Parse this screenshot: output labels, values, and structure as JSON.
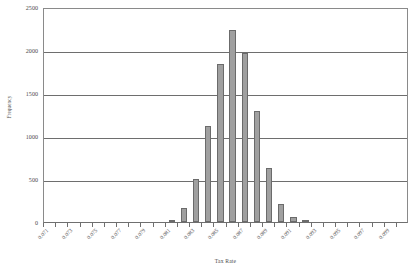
{
  "chart_data": {
    "type": "bar",
    "title": "",
    "subtitle": "",
    "xlabel": "Tax Rate",
    "ylabel": "Frequency",
    "grid": true,
    "legend": false,
    "legend_position": "none",
    "xlim": [
      0.0705,
      0.1005
    ],
    "ylim": [
      0,
      2500
    ],
    "ytick_labels": [
      "2500",
      "2000",
      "1500",
      "1000",
      "500",
      "0"
    ],
    "ytick_values": [
      2500,
      2000,
      1500,
      1000,
      500,
      0
    ],
    "xtick_labels": [
      "0.071",
      "",
      "0.073",
      "",
      "0.075",
      "",
      "0.077",
      "",
      "0.079",
      "",
      "0.081",
      "",
      "0.083",
      "",
      "0.085",
      "",
      "0.087",
      "",
      "0.089",
      "",
      "0.091",
      "",
      "0.093",
      "",
      "0.095",
      "",
      "0.097",
      "",
      "0.099",
      ""
    ],
    "categories": [
      "0.071",
      "0.072",
      "0.073",
      "0.074",
      "0.075",
      "0.076",
      "0.077",
      "0.078",
      "0.079",
      "0.080",
      "0.081",
      "0.082",
      "0.083",
      "0.084",
      "0.085",
      "0.086",
      "0.087",
      "0.088",
      "0.089",
      "0.090",
      "0.091",
      "0.092",
      "0.093",
      "0.094",
      "0.095",
      "0.096",
      "0.097",
      "0.098",
      "0.099",
      "0.100"
    ],
    "values": [
      0,
      0,
      0,
      0,
      0,
      0,
      0,
      0,
      0,
      0,
      20,
      165,
      500,
      1115,
      1840,
      2230,
      1960,
      1290,
      630,
      205,
      55,
      15,
      0,
      0,
      0,
      0,
      0,
      0,
      0,
      0
    ],
    "bar_color": "#a0a0a0",
    "bar_edge_color": "#6b6b6b"
  },
  "axis": {
    "frame_color": "#8a8a8a",
    "gridline_color": "#6e6e6e"
  }
}
